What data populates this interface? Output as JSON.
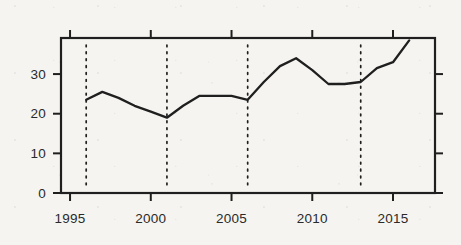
{
  "figure": {
    "background": "#f5f4f0",
    "frame_color": "#1f1f1f",
    "line_color": "#1f1f1f",
    "label_color": "#2a2a2a"
  },
  "chart_data": {
    "type": "line",
    "title": "",
    "xlabel": "",
    "ylabel": "",
    "x": [
      1996,
      1997,
      1998,
      1999,
      2000,
      2001,
      2002,
      2003,
      2004,
      2005,
      2006,
      2007,
      2008,
      2009,
      2010,
      2011,
      2012,
      2013,
      2014,
      2015,
      2016
    ],
    "values": [
      23.5,
      25.5,
      24,
      22,
      20.5,
      19,
      22,
      24.5,
      24.5,
      24.5,
      23.5,
      28,
      32,
      34,
      31,
      27.5,
      27.5,
      28,
      31.5,
      33,
      38.5
    ],
    "series": [
      {
        "name": "series-1",
        "values": [
          23.5,
          25.5,
          24,
          22,
          20.5,
          19,
          22,
          24.5,
          24.5,
          24.5,
          23.5,
          28,
          32,
          34,
          31,
          27.5,
          27.5,
          28,
          31.5,
          33,
          38.5
        ]
      }
    ],
    "xticks": [
      1995,
      2000,
      2005,
      2010,
      2015
    ],
    "yticks": [
      0,
      10,
      20,
      30
    ],
    "vlines": [
      1996,
      2001,
      2006,
      2013
    ],
    "xlim": [
      1994.44,
      2017.6
    ],
    "ylim": [
      0,
      39.1
    ],
    "grid": false,
    "legend": null
  }
}
